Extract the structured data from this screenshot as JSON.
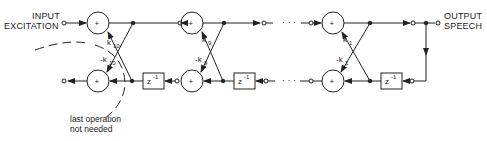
{
  "diagram": {
    "type": "lattice synthesis filter",
    "input_label_line1": "INPUT",
    "input_label_line2": "EXCITATION",
    "output_label_line1": "OUTPUT",
    "output_label_line2": "SPEECH",
    "adder_symbol": "+",
    "delay_label": "z",
    "delay_exponent": "-1",
    "ellipsis": "· · ·",
    "stages": [
      {
        "k_top": "k",
        "k_top_sub": "10",
        "k_bottom": "-k",
        "k_bottom_sub": "10"
      },
      {
        "k_top": "k",
        "k_top_sub": "9",
        "k_bottom": "-k",
        "k_bottom_sub": "9"
      },
      {
        "k_top": "k",
        "k_top_sub": "1",
        "k_bottom": "-k",
        "k_bottom_sub": "1"
      }
    ],
    "annotation_line1": "last operation",
    "annotation_line2": "not needed"
  },
  "colors": {
    "line": "#222222",
    "background": "#ffffff"
  }
}
